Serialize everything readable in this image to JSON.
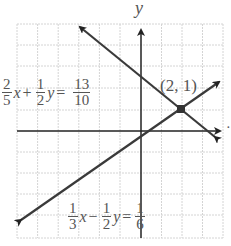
{
  "axes": {
    "y_label": "y",
    "x_label": "x"
  },
  "point": {
    "label": "(2, 1)",
    "x": 2,
    "y": 1
  },
  "equation1": {
    "a_num": "2",
    "a_den": "5",
    "var1": "x",
    "plus": "+",
    "b_num": "1",
    "b_den": "2",
    "var2": "y",
    "equals": "=",
    "c_num": "13",
    "c_den": "10"
  },
  "equation2": {
    "a_num": "1",
    "a_den": "3",
    "var1": "x",
    "minus": "−",
    "b_num": "1",
    "b_den": "2",
    "var2": "y",
    "equals": "=",
    "c_num": "1",
    "c_den": "6"
  },
  "colors": {
    "grid": "#cfcfcf",
    "axis": "#222222",
    "line": "#3a3a3a",
    "text": "#555555"
  }
}
